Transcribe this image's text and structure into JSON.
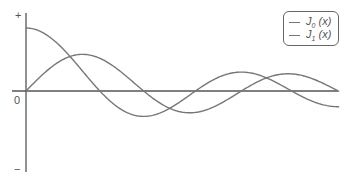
{
  "chart_data": {
    "type": "line",
    "title": "",
    "xlabel": "",
    "ylabel": "",
    "xlim": [
      0,
      10.2
    ],
    "ylim": [
      -1.3,
      1.2
    ],
    "grid": false,
    "legend_position": "top-right",
    "axis_labels": {
      "origin": "0",
      "y_positive": "+",
      "y_negative": "−"
    },
    "series": [
      {
        "name": "J0 (x)",
        "function": "bessel_j0",
        "color": "#777777",
        "x": [
          0,
          1,
          2,
          2.405,
          3,
          3.832,
          4,
          5,
          5.52,
          6,
          7,
          7.016,
          8,
          8.654,
          9,
          10,
          10.17
        ],
        "values": [
          1.0,
          0.765,
          0.224,
          0.0,
          -0.26,
          -0.403,
          -0.397,
          -0.178,
          0.0,
          0.151,
          0.3,
          0.3,
          0.172,
          0.0,
          -0.09,
          -0.246,
          -0.249
        ]
      },
      {
        "name": "J1 (x)",
        "function": "bessel_j1",
        "color": "#777777",
        "x": [
          0,
          1,
          1.841,
          2,
          3,
          3.832,
          4,
          5,
          5.331,
          6,
          7,
          7.016,
          8,
          8.536,
          9,
          10,
          10.17
        ],
        "values": [
          0.0,
          0.44,
          0.582,
          0.577,
          0.339,
          0.0,
          -0.066,
          -0.328,
          -0.346,
          -0.277,
          -0.005,
          0.0,
          0.235,
          0.273,
          0.245,
          0.043,
          0.0
        ]
      }
    ]
  },
  "legend": {
    "items": [
      {
        "base": "J",
        "sub": "0",
        "arg": " (x)"
      },
      {
        "base": "J",
        "sub": "1",
        "arg": " (x)"
      }
    ]
  },
  "axes": {
    "origin_label": "0",
    "plus_label": "+",
    "minus_label": "−"
  },
  "style": {
    "axis_color": "#555555",
    "curve_color": "#777777"
  }
}
